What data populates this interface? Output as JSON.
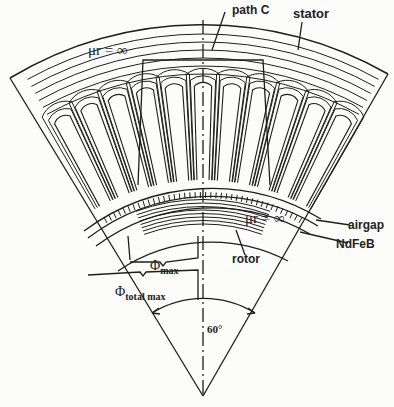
{
  "figure": {
    "labels": {
      "path_c": "path C",
      "stator": "stator",
      "mu_stator": "μr = ∞",
      "mu_rotor": "μr = ∞",
      "airgap": "airgap",
      "ndfeb": "NdFeB",
      "rotor": "rotor",
      "phi_max_symbol": "Φ",
      "phi_max_sub": "max",
      "phi_total_symbol": "Φ",
      "phi_total_sub": "total max",
      "angle": "60°"
    },
    "colors": {
      "line": "#1e1e1e",
      "background": "#fcfcfa"
    }
  }
}
